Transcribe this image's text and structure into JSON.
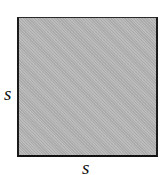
{
  "figure": {
    "shape": "square",
    "fill_color": "#b4b4b4",
    "border_color": "#1a1a1a",
    "labels": {
      "left_side": "s",
      "bottom_side": "s"
    }
  }
}
